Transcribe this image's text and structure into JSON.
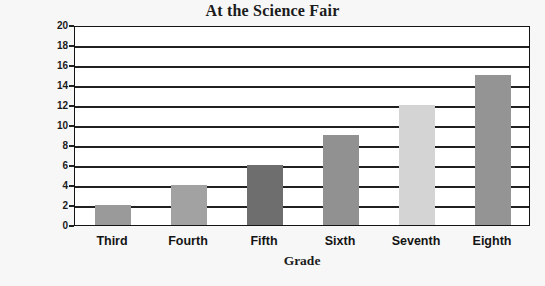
{
  "chart_data": {
    "type": "bar",
    "title": "At the Science Fair",
    "xlabel": "Grade",
    "ylabel": "Number of Students",
    "categories": [
      "Third",
      "Fourth",
      "Fifth",
      "Sixth",
      "Seventh",
      "Eighth"
    ],
    "values": [
      2,
      4,
      6,
      9,
      12,
      15
    ],
    "ylim": [
      0,
      20
    ],
    "ytick_labels": [
      "0",
      "2",
      "4",
      "6",
      "8",
      "10",
      "12",
      "14",
      "16",
      "18",
      "20"
    ],
    "ytick_values": [
      0,
      2,
      4,
      6,
      8,
      10,
      12,
      14,
      16,
      18,
      20
    ],
    "grid": "horizontal",
    "legend": "none",
    "bar_colors": [
      "#9a9a9a",
      "#a2a2a2",
      "#6e6e6e",
      "#919191",
      "#d4d4d4",
      "#949494"
    ],
    "frame_color": "#141414",
    "plot_background": "#ffffff",
    "page_background": "#f7f7f7"
  }
}
